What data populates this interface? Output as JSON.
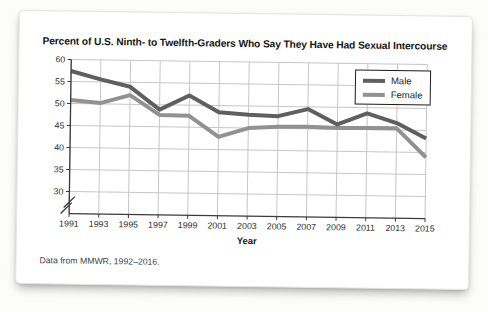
{
  "card": {
    "title": "Percent of U.S. Ninth- to Twelfth-Graders Who Say They Have Had Sexual Intercourse",
    "footnote": "Data from MMWR, 1992–2016."
  },
  "chart_data": {
    "type": "line",
    "title": "Percent of U.S. Ninth- to Twelfth-Graders Who Say They Have Had Sexual Intercourse",
    "x": [
      1991,
      1993,
      1995,
      1997,
      1999,
      2001,
      2003,
      2005,
      2007,
      2009,
      2011,
      2013,
      2015
    ],
    "series": [
      {
        "name": "Male",
        "color": "#5f5f5f",
        "values": [
          57.4,
          55.6,
          54.0,
          48.9,
          52.2,
          48.5,
          48.0,
          47.8,
          49.5,
          46.1,
          48.7,
          46.6,
          43.2
        ]
      },
      {
        "name": "Female",
        "color": "#919191",
        "values": [
          50.8,
          50.2,
          52.1,
          47.7,
          47.6,
          42.9,
          45.0,
          45.4,
          45.5,
          45.3,
          45.4,
          45.4,
          38.9
        ]
      }
    ],
    "xlabel": "Year",
    "ylabel": "",
    "ylim": [
      30,
      60
    ],
    "yticks": [
      30,
      35,
      40,
      45,
      50,
      55,
      60
    ],
    "axis_break": "below 30",
    "grid": true,
    "legend_position": "top-right",
    "colors": {
      "gridline": "#c6c6c6",
      "axis": "#3a3a3a",
      "tick_text": "#2d2d2d"
    }
  }
}
